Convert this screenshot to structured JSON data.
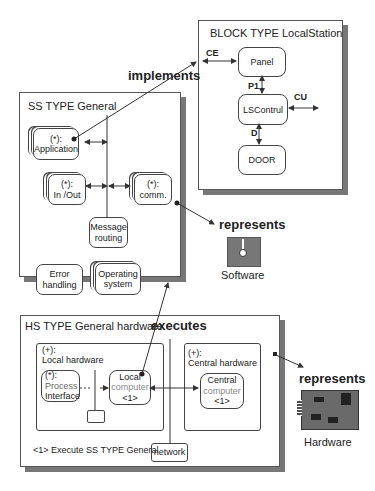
{
  "block_type": {
    "title": "BLOCK TYPE LocalStation",
    "nodes": {
      "panel": "Panel",
      "lscontrol": "LSContrul",
      "door": "DOOR"
    },
    "channels": {
      "ce": "CE",
      "p1": "P1",
      "cu": "CU",
      "d": "D"
    }
  },
  "relations": {
    "implements": "implements",
    "represents_software": "represents",
    "executes": "executes",
    "represents_hardware": "represents"
  },
  "ss_type": {
    "title": "SS TYPE General",
    "nodes": {
      "application_mult": "(*):",
      "application": "Application",
      "inout_mult": "(*):",
      "inout": "In /Out",
      "comm_mult": "(*):",
      "comm": "comm.",
      "message_routing_1": "Message",
      "message_routing_2": "routing",
      "error_handling_1": "Error",
      "error_handling_2": "handling",
      "os_1": "Operating",
      "os_2": "system"
    }
  },
  "software_icon": {
    "label": "Software"
  },
  "hs_type": {
    "title": "HS TYPE General hardware",
    "local_hardware": {
      "mult": "(+):",
      "label": "Local hardware",
      "process_interface_mult": "(*):",
      "process_interface_1": "Process",
      "process_interface_2": "Interface",
      "local_computer_1": "Local",
      "local_computer_2": "computer",
      "local_computer_ref": "<1>"
    },
    "central_hardware": {
      "mult": "(+):",
      "label": "Central hardware",
      "central_computer_1": "Central",
      "central_computer_2": "computer",
      "central_computer_ref": "<1>"
    },
    "network": "network",
    "footnote": "<1> Execute SS TYPE General"
  },
  "hardware_icon": {
    "label": "Hardware"
  },
  "colors": {
    "line": "#333333",
    "shadow": "#777777",
    "software_fill": "#7a7a7a",
    "hardware_fill": "#6e6e6e"
  }
}
